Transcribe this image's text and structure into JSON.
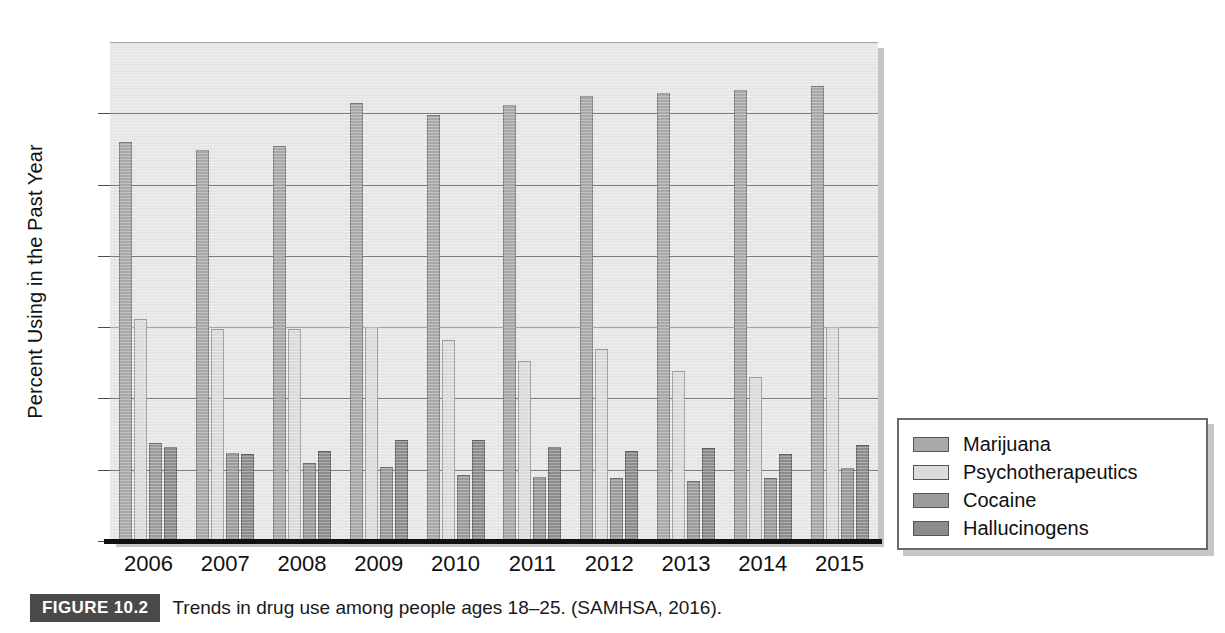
{
  "figure": {
    "badge": "FIGURE 10.2",
    "caption": "Trends in drug use among people ages 18–25. (SAMHSA, 2016)."
  },
  "legend": {
    "position": "right",
    "entries": [
      {
        "label": "Marijuana",
        "color": "#a9a9a9"
      },
      {
        "label": "Psychotherapeutics",
        "color": "#dcdcdc"
      },
      {
        "label": "Cocaine",
        "color": "#9b9b9b"
      },
      {
        "label": "Hallucinogens",
        "color": "#8c8c8c"
      }
    ]
  },
  "chart_data": {
    "type": "bar",
    "title": "",
    "xlabel": "",
    "ylabel": "Percent Using in the Past Year",
    "ylim": [
      0,
      35
    ],
    "yticks": [
      0,
      5,
      10,
      15,
      20,
      25,
      30,
      35
    ],
    "ytick_labels": [
      "0",
      "5",
      "10",
      "15",
      "20",
      "25",
      "30",
      "35"
    ],
    "grid": true,
    "grid_axis": "y",
    "legend_position": "right",
    "categories": [
      "2006",
      "2007",
      "2008",
      "2009",
      "2010",
      "2011",
      "2012",
      "2013",
      "2014",
      "2015"
    ],
    "series": [
      {
        "name": "Marijuana",
        "color": "#a9a9a9",
        "values": [
          28.0,
          27.4,
          27.7,
          30.7,
          29.9,
          30.6,
          31.2,
          31.4,
          31.6,
          31.9
        ]
      },
      {
        "name": "Psychotherapeutics",
        "color": "#dcdcdc",
        "values": [
          15.6,
          14.9,
          14.9,
          15.0,
          14.1,
          12.6,
          13.5,
          11.9,
          11.5,
          15.0
        ]
      },
      {
        "name": "Cocaine",
        "color": "#9b9b9b",
        "values": [
          6.9,
          6.2,
          5.5,
          5.2,
          4.6,
          4.5,
          4.4,
          4.2,
          4.4,
          5.1
        ]
      },
      {
        "name": "Hallucinogens",
        "color": "#8c8c8c",
        "values": [
          6.6,
          6.1,
          6.3,
          7.1,
          7.1,
          6.6,
          6.3,
          6.5,
          6.1,
          6.7
        ]
      }
    ]
  }
}
